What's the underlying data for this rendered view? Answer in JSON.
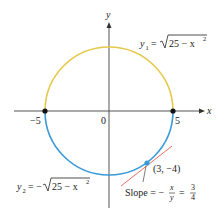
{
  "figure": {
    "title": "",
    "axes": {
      "x_label": "x",
      "y_label": "y",
      "origin_label": "0",
      "tick_labels": {
        "neg5": "−5",
        "pos5": "5"
      }
    },
    "curves": {
      "upper": {
        "label_var": "y",
        "label_sub": "1",
        "label_eq": "=",
        "label_expr": "25 − x",
        "label_exp": "2",
        "color": "#E5C84A"
      },
      "lower": {
        "label_var": "y",
        "label_sub": "2",
        "label_eq": "= −",
        "label_expr": "25 − x",
        "label_exp": "2",
        "color": "#3A9AD9"
      }
    },
    "point": {
      "label": "(3, −4)",
      "color": "#3A9AD9"
    },
    "tangent": {
      "color": "#E8604C"
    },
    "slope_annotation": {
      "prefix": "Slope = −",
      "frac1_num": "x",
      "frac1_den": "y",
      "equals": "=",
      "frac2_num": "3",
      "frac2_den": "4"
    },
    "colors": {
      "axis": "#555555",
      "endpoint": "#111111"
    }
  }
}
